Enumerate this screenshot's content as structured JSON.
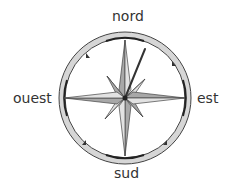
{
  "illustration": {
    "title": "compass rose",
    "labels": {
      "north": "nord",
      "east": "est",
      "south": "sud",
      "west": "ouest"
    },
    "colors": {
      "background": "#ffffff",
      "ring_fill": "#d6d6d6",
      "ring_stroke": "#444444",
      "star_dark": "#a8a8a8",
      "star_light": "#e2e2e2",
      "needle": "#333333"
    }
  }
}
